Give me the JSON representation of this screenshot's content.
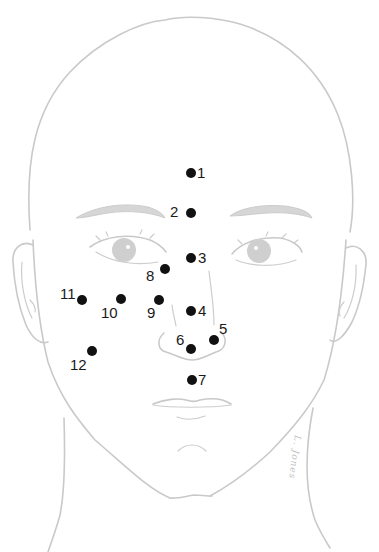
{
  "figure": {
    "line_color": "#c9c9c9",
    "dot_color": "#111111",
    "signature_text": "L. Jones"
  },
  "points": [
    {
      "label": "1",
      "x": 191,
      "y": 173,
      "label_dx": 6,
      "label_dy": -8
    },
    {
      "label": "2",
      "x": 191,
      "y": 213,
      "label_dx": -21,
      "label_dy": -9
    },
    {
      "label": "3",
      "x": 191,
      "y": 258,
      "label_dx": 7,
      "label_dy": -8
    },
    {
      "label": "4",
      "x": 191,
      "y": 311,
      "label_dx": 7,
      "label_dy": -8
    },
    {
      "label": "5",
      "x": 214,
      "y": 340,
      "label_dx": 5,
      "label_dy": -19
    },
    {
      "label": "6",
      "x": 191,
      "y": 349,
      "label_dx": -15,
      "label_dy": -17
    },
    {
      "label": "7",
      "x": 192,
      "y": 380,
      "label_dx": 6,
      "label_dy": -8
    },
    {
      "label": "8",
      "x": 165,
      "y": 269,
      "label_dx": -19,
      "label_dy": -1
    },
    {
      "label": "9",
      "x": 159,
      "y": 300,
      "label_dx": -12,
      "label_dy": 5
    },
    {
      "label": "10",
      "x": 121,
      "y": 299,
      "label_dx": -20,
      "label_dy": 6
    },
    {
      "label": "11",
      "x": 82,
      "y": 300,
      "label_dx": -22,
      "label_dy": -14
    },
    {
      "label": "12",
      "x": 92,
      "y": 351,
      "label_dx": -22,
      "label_dy": 6
    }
  ]
}
